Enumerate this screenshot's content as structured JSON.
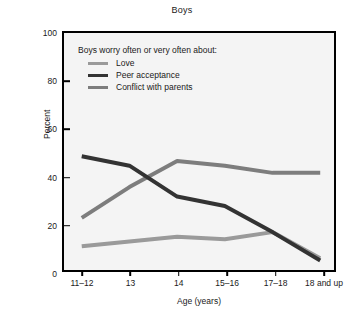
{
  "chart_data": {
    "type": "line",
    "title": "Boys",
    "xlabel": "Age (years)",
    "ylabel": "Percent",
    "categories": [
      "11–12",
      "13",
      "14",
      "15–16",
      "17–18",
      "18 and up"
    ],
    "ylim": [
      0,
      100
    ],
    "yticks": [
      0,
      20,
      40,
      60,
      80,
      100
    ],
    "grid": false,
    "legend_position": "inside-top-left",
    "legend_title": "Boys worry often or very often about:",
    "series": [
      {
        "name": "Love",
        "color": "#9a9a9a",
        "values": [
          10,
          12,
          14,
          13,
          16,
          5
        ]
      },
      {
        "name": "Peer acceptance",
        "color": "#333333",
        "values": [
          48,
          44,
          31,
          27,
          16,
          4
        ]
      },
      {
        "name": "Conflict with parents",
        "color": "#7d7d7d",
        "values": [
          22,
          35,
          46,
          44,
          41,
          41
        ]
      }
    ]
  },
  "figure": {
    "title": "Boys",
    "axis": {
      "y_label": "Percent",
      "x_label": "Age (years)",
      "y_ticks": [
        "0",
        "20",
        "40",
        "60",
        "80",
        "100"
      ],
      "x_ticks": [
        "11–12",
        "13",
        "14",
        "15–16",
        "17–18",
        "18 and up"
      ]
    },
    "legend": {
      "title": "Boys worry often or very often about:",
      "entries": [
        {
          "label": "Love",
          "color": "#9a9a9a"
        },
        {
          "label": "Peer acceptance",
          "color": "#333333"
        },
        {
          "label": "Conflict with parents",
          "color": "#7d7d7d"
        }
      ]
    },
    "style": {
      "plot_background": "#f4f4f4",
      "frame_color": "#000000",
      "page_background": "#ffffff"
    }
  }
}
